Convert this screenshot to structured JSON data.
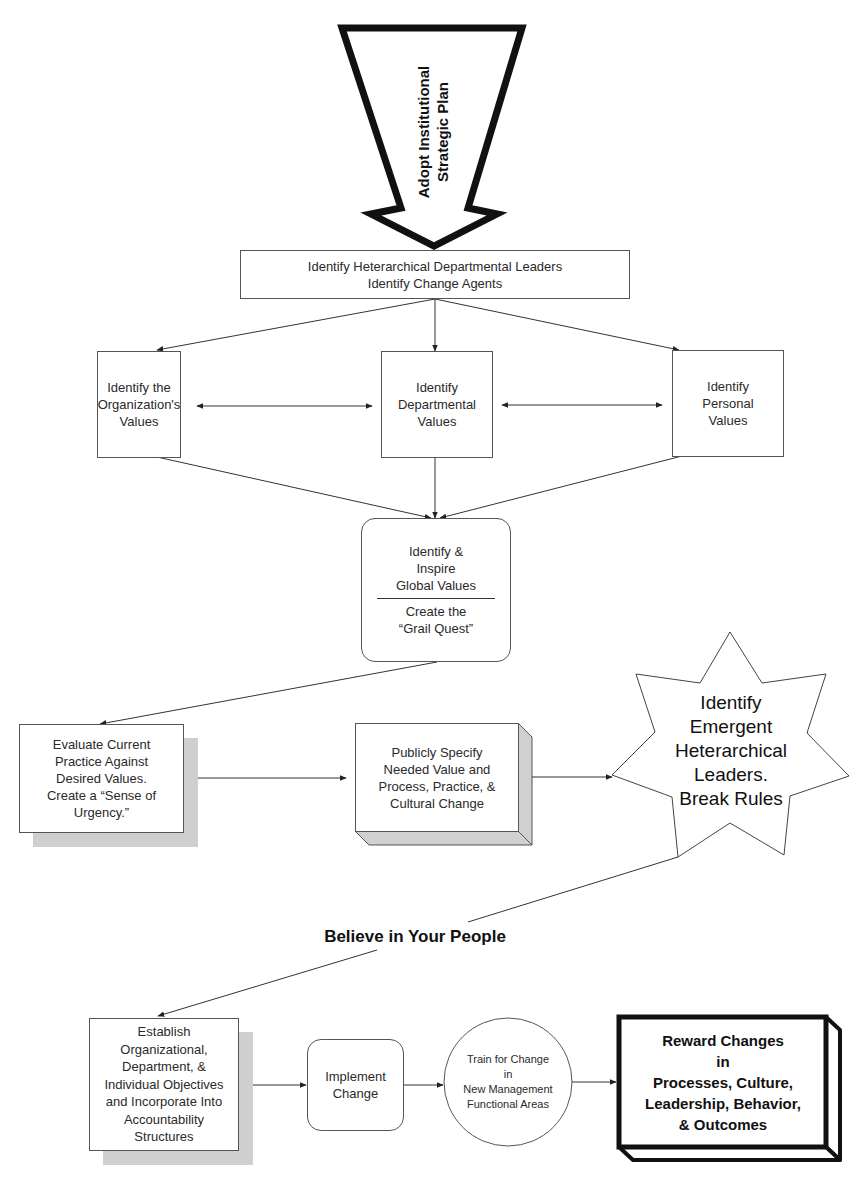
{
  "diagram": {
    "start_arrow": {
      "label": "Adopt Institutional\nStrategic Plan"
    },
    "leaders_box": {
      "label": "Identify Heterarchical Departmental Leaders\nIdentify Change Agents"
    },
    "values": {
      "organization": "Identify the\nOrganization's\nValues",
      "departmental": "Identify\nDepartmental\nValues",
      "personal": "Identify\nPersonal\nValues"
    },
    "global_values": {
      "top": "Identify &\nInspire\nGlobal Values",
      "bottom": "Create the\n“Grail Quest”"
    },
    "evaluate": {
      "label": "Evaluate Current\nPractice Against\nDesired Values.\nCreate a “Sense of\nUrgency.”"
    },
    "publicly_specify": {
      "label": "Publicly Specify\nNeeded Value and\nProcess, Practice, &\nCultural Change"
    },
    "emergent_leaders": {
      "label": "Identify\nEmergent\nHeterarchical\nLeaders.\nBreak Rules"
    },
    "believe_label": "Believe in Your People",
    "establish": {
      "label": "Establish\nOrganizational,\nDepartment, &\nIndividual Objectives\nand Incorporate Into\nAccountability\nStructures"
    },
    "implement": {
      "label": "Implement\nChange"
    },
    "train": {
      "label": "Train for Change\nin\nNew Management\nFunctional Areas"
    },
    "reward": {
      "label": "Reward Changes\nin\nProcesses, Culture,\nLeadership, Behavior,\n& Outcomes"
    }
  },
  "colors": {
    "line": "#333333",
    "shadow": "#cfcfcf",
    "text": "#222222"
  }
}
